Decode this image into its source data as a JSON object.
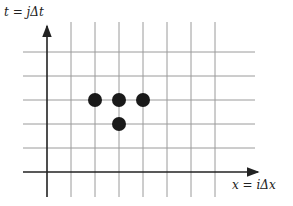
{
  "diagram": {
    "type": "stencil-grid",
    "axes": {
      "t_label": "t = jΔt",
      "x_label": "x = iΔx"
    },
    "grid": {
      "vertical_lines_x": [
        71,
        95,
        119,
        143,
        167,
        191,
        215
      ],
      "horizontal_lines_y": [
        52,
        76,
        100,
        124,
        148
      ],
      "axis_origin": {
        "x": 47,
        "y": 172
      },
      "spacing_px": 24
    },
    "stencil_points": [
      {
        "col": 2,
        "row": 3,
        "cx": 95,
        "cy": 100
      },
      {
        "col": 3,
        "row": 3,
        "cx": 119,
        "cy": 100
      },
      {
        "col": 4,
        "row": 3,
        "cx": 143,
        "cy": 100
      },
      {
        "col": 3,
        "row": 2,
        "cx": 119,
        "cy": 124
      }
    ],
    "colors": {
      "grid": "#9a9a9a",
      "axis": "#222222",
      "point": "#1a1a1a"
    }
  }
}
